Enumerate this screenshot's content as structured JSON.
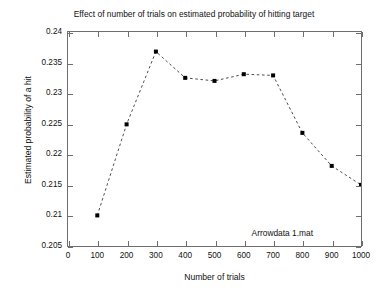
{
  "chart_data": {
    "type": "line",
    "title": "Effect of number of trials on estimated probability of hitting target",
    "xlabel": "Number of trials",
    "ylabel": "Estimated probability of a hit",
    "x": [
      100,
      200,
      300,
      400,
      500,
      600,
      700,
      800,
      900,
      1000
    ],
    "values": [
      0.21,
      0.2249,
      0.2368,
      0.2325,
      0.232,
      0.2331,
      0.2329,
      0.2235,
      0.2181,
      0.215
    ],
    "series": [
      {
        "name": "Arrowdata 1.mat",
        "values": [
          0.21,
          0.2249,
          0.2368,
          0.2325,
          0.232,
          0.2331,
          0.2329,
          0.2235,
          0.2181,
          0.215
        ]
      }
    ],
    "xlim": [
      0,
      1000
    ],
    "ylim": [
      0.205,
      0.24
    ],
    "xticks": [
      0,
      100,
      200,
      300,
      400,
      500,
      600,
      700,
      800,
      900,
      1000
    ],
    "yticks": [
      0.205,
      0.21,
      0.215,
      0.22,
      0.225,
      0.23,
      0.235,
      0.24
    ],
    "xtick_labels": [
      "0",
      "100",
      "200",
      "300",
      "400",
      "500",
      "600",
      "700",
      "800",
      "900",
      "1000"
    ],
    "ytick_labels": [
      "0.205",
      "0.21",
      "0.215",
      "0.22",
      "0.225",
      "0.23",
      "0.235",
      "0.24"
    ],
    "grid": false,
    "legend": false,
    "annotation": "Arrowdata 1.mat",
    "line_style": "dashed",
    "marker": "square",
    "line_color": "#4d4d4d",
    "marker_color": "#000000",
    "axis_color": "#6e6e6e",
    "background": "#ffffff"
  }
}
